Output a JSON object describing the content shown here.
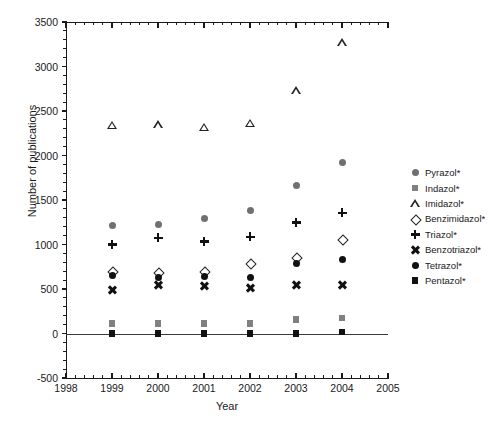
{
  "chart_data": {
    "type": "scatter",
    "title": "",
    "xlabel": "Year",
    "ylabel": "Number of publications",
    "xlim": [
      1998,
      2005
    ],
    "ylim": [
      -500,
      3500
    ],
    "ytick_step": 500,
    "grid": false,
    "legend_position": "right",
    "x": [
      1999,
      2000,
      2001,
      2002,
      2003,
      2004
    ],
    "xticks": [
      "1998",
      "1999",
      "2000",
      "2001",
      "2002",
      "2003",
      "2004",
      "2005"
    ],
    "yticks": [
      "-500",
      "0",
      "500",
      "1000",
      "1500",
      "2000",
      "2500",
      "3000",
      "3500"
    ],
    "series": [
      {
        "name": "Pyrazol*",
        "marker": "circle-gray",
        "values": [
          1215,
          1220,
          1290,
          1385,
          1660,
          1920
        ]
      },
      {
        "name": "Indazol*",
        "marker": "square-gray",
        "values": [
          110,
          110,
          110,
          110,
          155,
          175
        ]
      },
      {
        "name": "Imidazol*",
        "marker": "triangle-open",
        "values": [
          2340,
          2345,
          2320,
          2365,
          2730,
          3270
        ]
      },
      {
        "name": "Benzimidazol*",
        "marker": "diamond-open",
        "values": [
          700,
          690,
          700,
          790,
          860,
          1060
        ]
      },
      {
        "name": "Triazol*",
        "marker": "plus",
        "values": [
          1000,
          1075,
          1035,
          1085,
          1245,
          1355
        ]
      },
      {
        "name": "Benzotriazol*",
        "marker": "cross",
        "values": [
          490,
          540,
          530,
          510,
          540,
          550
        ]
      },
      {
        "name": "Tetrazol*",
        "marker": "circle-black",
        "values": [
          655,
          630,
          635,
          625,
          790,
          830
        ]
      },
      {
        "name": "Pentazol*",
        "marker": "square-black",
        "values": [
          0,
          0,
          0,
          0,
          0,
          15
        ]
      }
    ]
  },
  "legend": {
    "items": [
      {
        "label": "Pyrazol*",
        "marker": "circle-gray"
      },
      {
        "label": "Indazol*",
        "marker": "square-gray"
      },
      {
        "label": "Imidazol*",
        "marker": "triangle-open"
      },
      {
        "label": "Benzimidazol*",
        "marker": "diamond-open"
      },
      {
        "label": "Triazol*",
        "marker": "plus"
      },
      {
        "label": "Benzotriazol*",
        "marker": "cross"
      },
      {
        "label": "Tetrazol*",
        "marker": "circle-black"
      },
      {
        "label": "Pentazol*",
        "marker": "square-black"
      }
    ]
  },
  "axes": {
    "x_title": "Year",
    "y_title": "Number of publications"
  }
}
